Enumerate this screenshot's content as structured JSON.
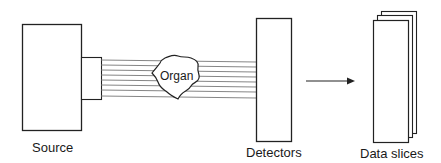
{
  "diagram": {
    "nodes": {
      "source": {
        "label": "Source"
      },
      "organ": {
        "label": "Organ"
      },
      "detectors": {
        "label": "Detectors"
      },
      "data_slices": {
        "label": "Data slices"
      }
    },
    "edges": [
      {
        "from": "source",
        "to": "detectors",
        "type": "parallel-beams",
        "count": 8,
        "through": "organ"
      },
      {
        "from": "detectors",
        "to": "data_slices",
        "type": "arrow"
      }
    ],
    "colors": {
      "stroke": "#222222",
      "beam": "#666666",
      "background": "#ffffff"
    }
  }
}
